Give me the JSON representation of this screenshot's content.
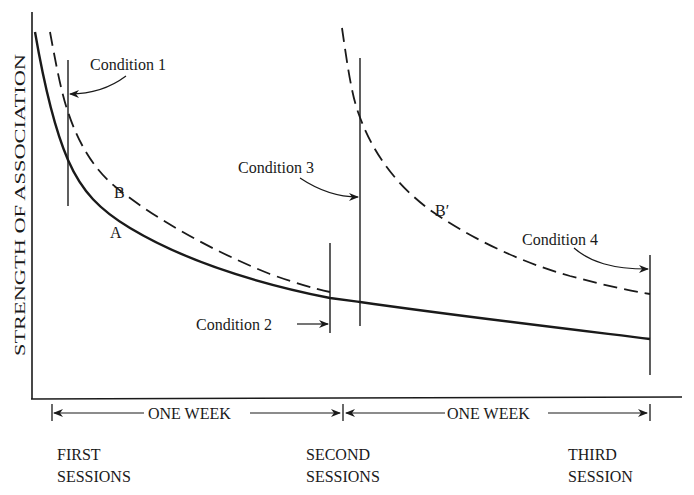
{
  "diagram": {
    "y_axis_label": "STRENGTH OF ASSOCIATION",
    "curves": [
      {
        "name": "A",
        "label": "A",
        "style": "solid"
      },
      {
        "name": "B",
        "label": "B",
        "style": "dashed"
      },
      {
        "name": "B-prime",
        "label": "B′",
        "style": "dashed"
      }
    ],
    "conditions": [
      {
        "label": "Condition 1"
      },
      {
        "label": "Condition 2"
      },
      {
        "label": "Condition 3"
      },
      {
        "label": "Condition 4"
      }
    ],
    "intervals": [
      {
        "label": "ONE WEEK"
      },
      {
        "label": "ONE WEEK"
      }
    ],
    "sessions": [
      {
        "line1": "FIRST",
        "line2": "SESSIONS"
      },
      {
        "line1": "SECOND",
        "line2": "SESSIONS"
      },
      {
        "line1": "THIRD",
        "line2": "SESSION"
      }
    ],
    "colors": {
      "ink": "#1a1a1a",
      "background": "#ffffff"
    }
  }
}
